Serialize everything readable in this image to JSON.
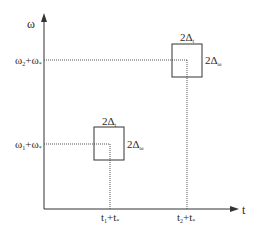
{
  "axes": {
    "y_label": "ω",
    "x_label": "t"
  },
  "points": [
    {
      "name": "upper",
      "omega_label": {
        "base": "ω",
        "sub1": "2",
        "plus": "+ω",
        "sub2": "*"
      },
      "t_label": {
        "base": "t",
        "sub1": "2",
        "plus": "+t",
        "sub2": "*"
      },
      "box_width_label": {
        "text": "2Δ",
        "sub": "t"
      },
      "box_height_label": {
        "text": "2Δ",
        "sub": "ω"
      }
    },
    {
      "name": "lower",
      "omega_label": {
        "base": "ω",
        "sub1": "1",
        "plus": "+ω",
        "sub2": "*"
      },
      "t_label": {
        "base": "t",
        "sub1": "1",
        "plus": "+t",
        "sub2": "*"
      },
      "box_width_label": {
        "text": "2Δ",
        "sub": "t"
      },
      "box_height_label": {
        "text": "2Δ",
        "sub": "ω"
      }
    }
  ],
  "colors": {
    "line": "#333333",
    "dotted": "#555555"
  }
}
